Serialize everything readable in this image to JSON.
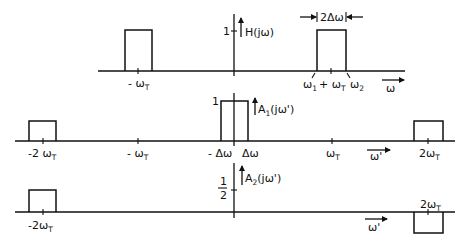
{
  "colors": {
    "ink": "#111111",
    "background": "#ffffff"
  },
  "panels": [
    {
      "id": "H",
      "function_label": "H(jω)",
      "axis_variable": "ω",
      "amplitude_label": "1",
      "width_annotation": "2Δω",
      "tick_labels": {
        "neg": "- ω",
        "neg_sub": "T",
        "w1": "ω",
        "w1_sub": "1",
        "pos": "+ ω",
        "pos_sub": "T",
        "w2": "ω",
        "w2_sub": "2"
      }
    },
    {
      "id": "A1",
      "function_label_main": "A",
      "function_label_sub": "1",
      "function_label_rest": "(jω')",
      "axis_variable": "ω'",
      "amplitude_label": "1",
      "tick_labels": {
        "m2": "-2 ω",
        "m1": "- ω",
        "mdw": "- Δω",
        "dw": "Δω",
        "p1": "ω",
        "p2": "2ω",
        "T": "T"
      }
    },
    {
      "id": "A2",
      "function_label_main": "A",
      "function_label_sub": "2",
      "function_label_rest": "(jω')",
      "axis_variable": "ω'",
      "amplitude_num": "1",
      "amplitude_den": "2",
      "tick_labels": {
        "m2": "-2ω",
        "p2": "2ω",
        "T": "T"
      }
    }
  ]
}
